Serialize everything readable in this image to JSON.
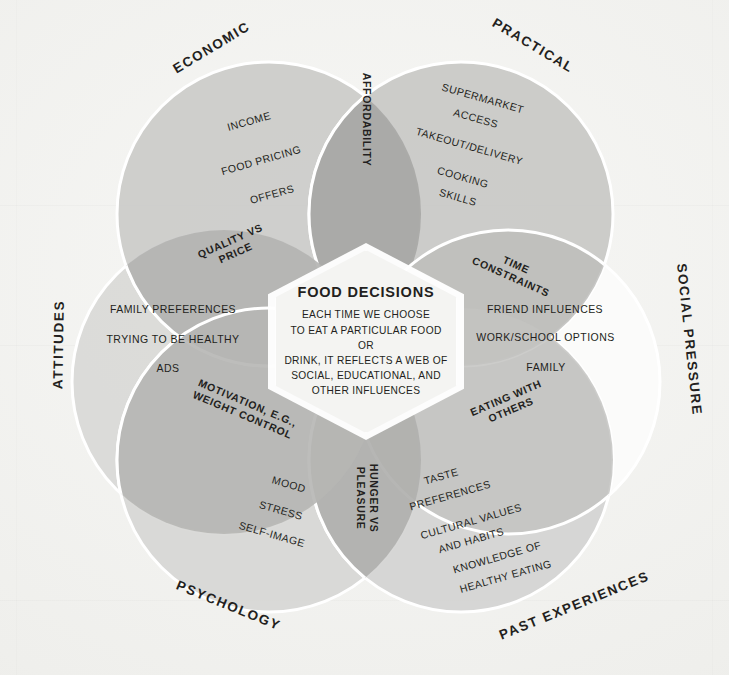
{
  "diagram": {
    "center": {
      "heading": "FOOD DECISIONS",
      "lines": [
        "EACH TIME WE CHOOSE",
        "TO EAT A PARTICULAR FOOD OR",
        "DRINK, IT REFLECTS A WEB OF",
        "SOCIAL, EDUCATIONAL, AND",
        "OTHER INFLUENCES"
      ]
    },
    "colors": {
      "background": "#f2f2f0",
      "circle_fill_mid": "#c9c9c7",
      "circle_fill_light": "#d8d8d6",
      "circle_fill_white": "#fbfbfa",
      "overlap_dark": "#a9a9a7",
      "overlap_mid": "#bcbcba",
      "text": "#231f20",
      "hexagon_fill": "#f4f4f2",
      "hexagon_border": "#ffffff"
    },
    "circles": [
      {
        "id": "economic",
        "label": "ECONOMIC",
        "items": [
          "INCOME",
          "FOOD PRICING",
          "OFFERS"
        ]
      },
      {
        "id": "practical",
        "label": "PRACTICAL",
        "items": [
          "SUPERMARKET",
          "ACCESS",
          "TAKEOUT/DELIVERY",
          "COOKING",
          "SKILLS"
        ]
      },
      {
        "id": "social_pressure",
        "label": "SOCIAL PRESSURE",
        "items": [
          "FRIEND INFLUENCES",
          "WORK/SCHOOL OPTIONS",
          "FAMILY"
        ]
      },
      {
        "id": "past_experiences",
        "label": "PAST EXPERIENCES",
        "items": [
          "TASTE",
          "PREFERENCES",
          "CULTURAL VALUES",
          "AND HABITS",
          "KNOWLEDGE OF",
          "HEALTHY EATING"
        ]
      },
      {
        "id": "psychology",
        "label": "PSYCHOLOGY",
        "items": [
          "MOOD",
          "STRESS",
          "SELF-IMAGE"
        ]
      },
      {
        "id": "attitudes",
        "label": "ATTITUDES",
        "items": [
          "FAMILY PREFERENCES",
          "TRYING TO BE HEALTHY",
          "ADS"
        ]
      }
    ],
    "overlaps": [
      {
        "id": "affordability",
        "line1": "AFFORDABILITY",
        "line2": "",
        "between": [
          "ECONOMIC",
          "PRACTICAL"
        ]
      },
      {
        "id": "quality_vs_price",
        "line1": "QUALITY VS",
        "line2": "PRICE",
        "between": [
          "ECONOMIC",
          "ATTITUDES"
        ]
      },
      {
        "id": "time_constraints",
        "line1": "TIME",
        "line2": "CONSTRAINTS",
        "between": [
          "PRACTICAL",
          "SOCIAL PRESSURE"
        ]
      },
      {
        "id": "eating_with_others",
        "line1": "EATING WITH",
        "line2": "OTHERS",
        "between": [
          "SOCIAL PRESSURE",
          "PAST EXPERIENCES"
        ]
      },
      {
        "id": "hunger_vs_pleasure",
        "line1": "HUNGER VS",
        "line2": "PLEASURE",
        "between": [
          "PAST EXPERIENCES",
          "PSYCHOLOGY"
        ]
      },
      {
        "id": "motivation_weight_control",
        "line1": "MOTIVATION, E.G.,",
        "line2": "WEIGHT CONTROL",
        "between": [
          "PSYCHOLOGY",
          "ATTITUDES"
        ]
      }
    ]
  }
}
